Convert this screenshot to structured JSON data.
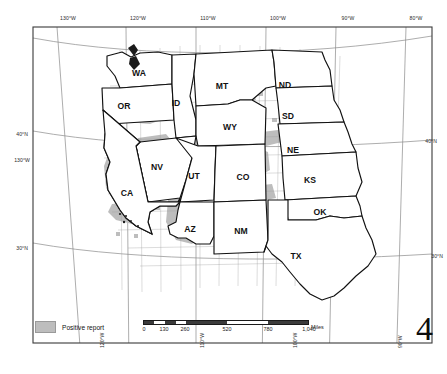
{
  "figure": {
    "number": "4",
    "projection_note": ""
  },
  "graticule": {
    "longitude_labels_top": [
      "130°W",
      "120°W",
      "110°W",
      "100°W",
      "90°W",
      "80°W"
    ],
    "longitude_labels_bottom": [
      "120°W",
      "110°W",
      "100°W",
      "90°W"
    ],
    "latitude_labels_left": [
      "40°N",
      "130°W",
      "30°N"
    ],
    "latitude_labels_right": [
      "40°N",
      "30°N"
    ],
    "lat_left_40": "40°N",
    "lat_left_130w": "130°W",
    "lat_left_30": "30°N",
    "lat_right_40": "40°N",
    "lat_right_30": "30°N"
  },
  "legend": {
    "label": "Positive report",
    "swatch_color": "#bdbdbd"
  },
  "scalebar": {
    "ticks": [
      "0",
      "130",
      "260",
      "520",
      "780",
      "1,040"
    ],
    "units": "Miles"
  },
  "states": [
    {
      "code": "WA",
      "x": 139,
      "y": 73
    },
    {
      "code": "OR",
      "x": 124,
      "y": 106
    },
    {
      "code": "ID",
      "x": 176,
      "y": 103
    },
    {
      "code": "MT",
      "x": 222,
      "y": 86
    },
    {
      "code": "ND",
      "x": 285,
      "y": 85
    },
    {
      "code": "SD",
      "x": 288,
      "y": 116
    },
    {
      "code": "WY",
      "x": 230,
      "y": 127
    },
    {
      "code": "NE",
      "x": 293,
      "y": 150
    },
    {
      "code": "NV",
      "x": 157,
      "y": 167
    },
    {
      "code": "UT",
      "x": 194,
      "y": 176
    },
    {
      "code": "CO",
      "x": 243,
      "y": 177
    },
    {
      "code": "KS",
      "x": 310,
      "y": 180
    },
    {
      "code": "CA",
      "x": 127,
      "y": 193
    },
    {
      "code": "AZ",
      "x": 190,
      "y": 229
    },
    {
      "code": "NM",
      "x": 241,
      "y": 231
    },
    {
      "code": "OK",
      "x": 320,
      "y": 212
    },
    {
      "code": "TX",
      "x": 296,
      "y": 256
    }
  ],
  "colors": {
    "positive_fill": "#bdbdbd",
    "state_outline": "#111111",
    "graticule": "#8a8a8a",
    "frame": "#3a3a3a",
    "background": "#ffffff"
  }
}
